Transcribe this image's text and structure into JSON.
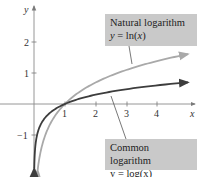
{
  "chart_data": {
    "type": "line",
    "title": "",
    "xlabel": "x",
    "ylabel": "y",
    "xlim": [
      0,
      5.2
    ],
    "ylim": [
      -2.1,
      2.9
    ],
    "x_ticks": [
      1,
      2,
      3,
      4
    ],
    "y_ticks": [
      -1,
      1,
      2
    ],
    "grid": false,
    "series": [
      {
        "name": "Natural logarithm",
        "equation": "y = ln(x)",
        "function": "ln",
        "color": "#a9a9a9",
        "x": [
          0.12,
          0.2,
          0.3,
          0.5,
          0.75,
          1,
          1.5,
          2,
          2.5,
          3,
          3.5,
          4,
          4.5,
          5
        ],
        "values": [
          -2.12,
          -1.61,
          -1.2,
          -0.69,
          -0.29,
          0,
          0.41,
          0.69,
          0.92,
          1.1,
          1.25,
          1.39,
          1.5,
          1.61
        ]
      },
      {
        "name": "Common logarithm",
        "equation": "y = log(x)",
        "function": "log10",
        "color": "#3d3d3d",
        "x": [
          0.008,
          0.02,
          0.05,
          0.1,
          0.2,
          0.5,
          1,
          1.5,
          2,
          3,
          4,
          5
        ],
        "values": [
          -2.1,
          -1.7,
          -1.3,
          -1.0,
          -0.7,
          -0.3,
          0,
          0.18,
          0.3,
          0.48,
          0.6,
          0.7
        ]
      }
    ],
    "annotations": [
      {
        "text": "Natural logarithm",
        "subtext": "y = ln(x)",
        "target": "Natural logarithm"
      },
      {
        "text": "Common logarithm",
        "subtext": "y = log(x)",
        "target": "Common logarithm"
      }
    ]
  },
  "labels": {
    "x_axis": "x",
    "y_axis": "y",
    "x_ticks": [
      "1",
      "2",
      "3",
      "4"
    ],
    "y_ticks": [
      "2",
      "1",
      "−1"
    ],
    "ln_title": "Natural logarithm",
    "ln_eq_prefix": "y = ln(",
    "ln_eq_var": "x",
    "ln_eq_suffix": ")",
    "log_title": "Common logarithm",
    "log_eq": "y = log(x)"
  },
  "colors": {
    "axis": "#8a8a8a",
    "ln_curve": "#a9a9a9",
    "log_curve": "#3d3d3d",
    "callout_bg": "#c9c9c9"
  }
}
